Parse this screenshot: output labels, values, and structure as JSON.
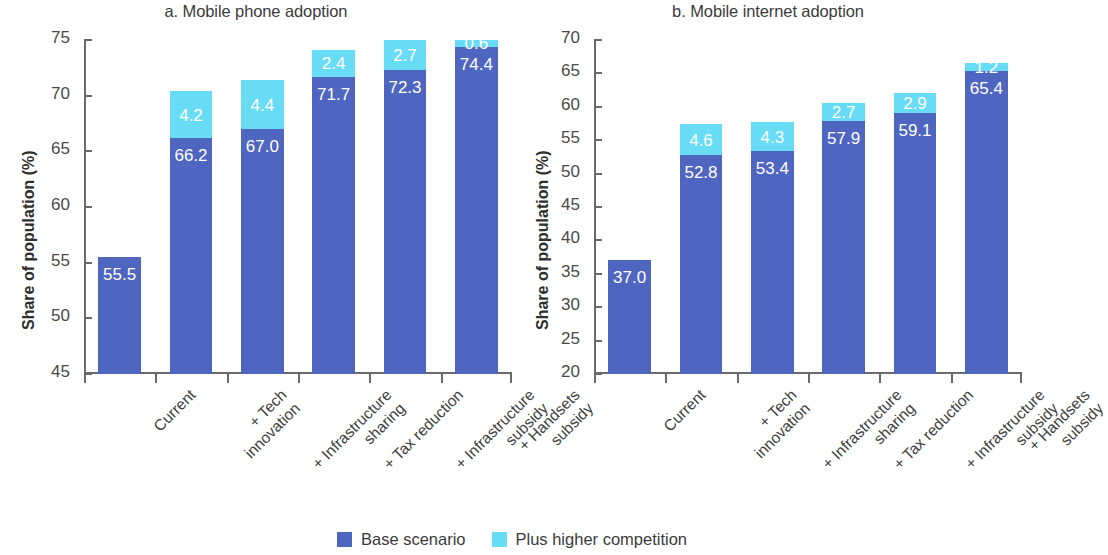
{
  "legend": {
    "items": [
      {
        "label": "Base scenario",
        "key": "base",
        "color": "#4f66c0"
      },
      {
        "label": "Plus higher competition",
        "key": "plus",
        "color": "#68dcf5"
      }
    ]
  },
  "categories": [
    {
      "line1": "Current",
      "line2": ""
    },
    {
      "line1": "+ Tech",
      "line2": "innovation"
    },
    {
      "line1": "+ Infrastructure",
      "line2": "sharing"
    },
    {
      "line1": "+ Tax reduction",
      "line2": ""
    },
    {
      "line1": "+ Infrastructure",
      "line2": "subsidy"
    },
    {
      "line1": "+ Handsets",
      "line2": "subsidy"
    }
  ],
  "panel_a": {
    "title": "a. Mobile phone adoption",
    "ylabel": "Share of population (%)",
    "yticks": [
      "45",
      "50",
      "55",
      "60",
      "65",
      "70",
      "75"
    ],
    "base_labels": [
      "55.5",
      "66.2",
      "67.0",
      "71.7",
      "72.3",
      "74.4"
    ],
    "plus_labels": [
      "",
      "4.2",
      "4.4",
      "2.4",
      "2.7",
      "0.6"
    ]
  },
  "panel_b": {
    "title": "b. Mobile internet adoption",
    "ylabel": "Share of population (%)",
    "yticks": [
      "20",
      "25",
      "30",
      "35",
      "40",
      "45",
      "50",
      "55",
      "60",
      "65",
      "70"
    ],
    "base_labels": [
      "37.0",
      "52.8",
      "53.4",
      "57.9",
      "59.1",
      "65.4"
    ],
    "plus_labels": [
      "",
      "4.6",
      "4.3",
      "2.7",
      "2.9",
      "1.2"
    ]
  },
  "chart_data": [
    {
      "type": "bar",
      "stacked": true,
      "title": "a. Mobile phone adoption",
      "xlabel": "",
      "ylabel": "Share of population (%)",
      "ylim": [
        45,
        75
      ],
      "yticks": [
        45,
        50,
        55,
        60,
        65,
        70,
        75
      ],
      "grid": false,
      "legend_position": "bottom-center",
      "categories": [
        "Current",
        "+ Tech innovation",
        "+ Infrastructure sharing",
        "+ Tax reduction",
        "+ Infrastructure subsidy",
        "+ Handsets subsidy"
      ],
      "series": [
        {
          "name": "Base scenario",
          "color": "#4f66c0",
          "values": [
            55.5,
            66.2,
            67.0,
            71.7,
            72.3,
            74.4
          ]
        },
        {
          "name": "Plus higher competition",
          "color": "#68dcf5",
          "values": [
            0,
            4.2,
            4.4,
            2.4,
            2.7,
            0.6
          ]
        }
      ],
      "totals": [
        55.5,
        70.4,
        71.4,
        74.1,
        75.0,
        75.0
      ]
    },
    {
      "type": "bar",
      "stacked": true,
      "title": "b. Mobile internet adoption",
      "xlabel": "",
      "ylabel": "Share of population (%)",
      "ylim": [
        20,
        70
      ],
      "yticks": [
        20,
        25,
        30,
        35,
        40,
        45,
        50,
        55,
        60,
        65,
        70
      ],
      "grid": false,
      "legend_position": "bottom-center",
      "categories": [
        "Current",
        "+ Tech innovation",
        "+ Infrastructure sharing",
        "+ Tax reduction",
        "+ Infrastructure subsidy",
        "+ Handsets subsidy"
      ],
      "series": [
        {
          "name": "Base scenario",
          "color": "#4f66c0",
          "values": [
            37.0,
            52.8,
            53.4,
            57.9,
            59.1,
            65.4
          ]
        },
        {
          "name": "Plus higher competition",
          "color": "#68dcf5",
          "values": [
            0,
            4.6,
            4.3,
            2.7,
            2.9,
            1.2
          ]
        }
      ],
      "totals": [
        37.0,
        57.4,
        57.7,
        60.6,
        62.0,
        66.6
      ]
    }
  ]
}
